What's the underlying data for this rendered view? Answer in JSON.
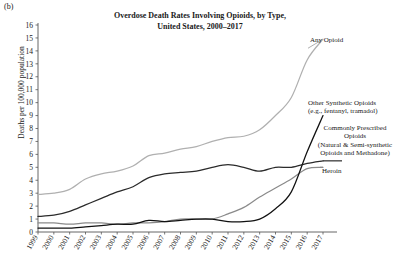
{
  "panel_label": "(b)",
  "title_line1": "Overdose Death Rates Involving Opioids, by Type,",
  "title_line2": "United States, 2000–2017",
  "ylabel": "Deaths per 100,000 population",
  "annotations": {
    "any_opioid": "Any Opioid",
    "other_synthetic_l1": "Other Synthetic Opioids",
    "other_synthetic_l2": "(e.g., fentanyl, tramadol)",
    "prescribed_l1": "Commonly Prescribed",
    "prescribed_l2": "Opioids",
    "prescribed_l3": "(Natural & Semi-synthetic",
    "prescribed_l4": "Opioids and Methadone)",
    "heroin": "Heroin"
  },
  "colors": {
    "any_opioid": "#b0b0b0",
    "prescribed": "#2b2b2b",
    "heroin": "#8a8a8a",
    "other_synthetic": "#111111",
    "axis": "#555555"
  },
  "chart_data": {
    "type": "line",
    "title": "Overdose Death Rates Involving Opioids, by Type, United States, 2000–2017",
    "xlabel": "",
    "ylabel": "Deaths per 100,000 population",
    "xlim": [
      1999,
      2017
    ],
    "ylim": [
      0,
      16
    ],
    "yticks": [
      0,
      1,
      2,
      3,
      4,
      5,
      6,
      7,
      8,
      9,
      10,
      11,
      12,
      13,
      14,
      15,
      16
    ],
    "grid": false,
    "legend_position": "right-inline-annotations",
    "x": [
      1999,
      2000,
      2001,
      2002,
      2003,
      2004,
      2005,
      2006,
      2007,
      2008,
      2009,
      2010,
      2011,
      2012,
      2013,
      2014,
      2015,
      2016,
      2017
    ],
    "categories": [
      "1999",
      "2000",
      "2001",
      "2002",
      "2003",
      "2004",
      "2005",
      "2006",
      "2007",
      "2008",
      "2009",
      "2010",
      "2011",
      "2012",
      "2013",
      "2014",
      "2015",
      "2016",
      "2017"
    ],
    "series": [
      {
        "name": "Any Opioid",
        "color": "#b0b0b0",
        "values": [
          2.9,
          3.0,
          3.3,
          4.1,
          4.5,
          4.7,
          5.1,
          5.9,
          6.1,
          6.4,
          6.6,
          7.0,
          7.3,
          7.4,
          7.9,
          9.0,
          10.4,
          13.3,
          14.9
        ]
      },
      {
        "name": "Commonly Prescribed Opioids (Natural & Semi-synthetic Opioids and Methadone)",
        "color": "#2b2b2b",
        "values": [
          1.2,
          1.3,
          1.6,
          2.1,
          2.6,
          3.1,
          3.5,
          4.2,
          4.5,
          4.6,
          4.7,
          5.0,
          5.2,
          5.0,
          4.7,
          5.0,
          5.0,
          5.3,
          5.5
        ]
      },
      {
        "name": "Heroin",
        "color": "#8a8a8a",
        "values": [
          0.7,
          0.7,
          0.6,
          0.7,
          0.7,
          0.6,
          0.7,
          0.7,
          0.8,
          1.0,
          1.0,
          1.0,
          1.4,
          1.9,
          2.7,
          3.4,
          4.1,
          4.9,
          5.0
        ]
      },
      {
        "name": "Other Synthetic Opioids (e.g., fentanyl, tramadol)",
        "color": "#111111",
        "values": [
          0.3,
          0.3,
          0.3,
          0.4,
          0.5,
          0.6,
          0.6,
          0.9,
          0.8,
          0.9,
          1.0,
          1.0,
          0.8,
          0.8,
          1.0,
          1.8,
          3.1,
          6.2,
          9.0
        ]
      }
    ]
  }
}
